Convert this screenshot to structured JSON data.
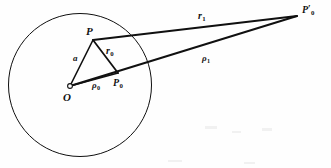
{
  "figure": {
    "background_color": "#fefefe",
    "stroke_color": "#101010",
    "circle": {
      "name": "boundary-circle",
      "center_x": 80,
      "center_y": 85,
      "radius": 71.5,
      "stroke_width": 1.0
    },
    "points": [
      {
        "id": "O",
        "label": "O",
        "sub": "",
        "prime": false,
        "x": 70,
        "y": 86,
        "marker": "open-circle",
        "label_x": 63,
        "label_y": 92,
        "size": "sz-big"
      },
      {
        "id": "P",
        "label": "P",
        "sub": "",
        "prime": false,
        "x": 93,
        "y": 40,
        "marker": "none",
        "label_x": 86,
        "label_y": 26,
        "size": "sz-big"
      },
      {
        "id": "P0",
        "label": "P",
        "sub": "0",
        "prime": false,
        "x": 118,
        "y": 73,
        "marker": "none",
        "label_x": 113,
        "label_y": 78,
        "size": "sz-mid"
      },
      {
        "id": "P0prime",
        "label": "P",
        "sub": "0",
        "prime": true,
        "x": 297,
        "y": 16,
        "marker": "none",
        "label_x": 302,
        "label_y": 5,
        "size": "sz-mid"
      }
    ],
    "segments": [
      {
        "id": "a",
        "from": "O",
        "to": "P",
        "stroke_width": 1.6
      },
      {
        "id": "r0",
        "from": "P",
        "to": "P0",
        "stroke_width": 1.8
      },
      {
        "id": "rho0",
        "from": "O",
        "to": "P0",
        "stroke_width": 1.6
      },
      {
        "id": "r1",
        "from": "P",
        "to": "P0prime",
        "stroke_width": 2.0
      },
      {
        "id": "rho1",
        "from": "O",
        "to": "P0prime",
        "stroke_width": 2.0
      }
    ],
    "length_labels": [
      {
        "id": "a",
        "label": "a",
        "sub": "",
        "x": 73,
        "y": 54,
        "size": "sz-sm"
      },
      {
        "id": "r0",
        "label": "r",
        "sub": "0",
        "x": 106,
        "y": 46,
        "size": "sz-mid"
      },
      {
        "id": "rho0",
        "label": "ρ",
        "sub": "0",
        "x": 92,
        "y": 81,
        "size": "sz-mid"
      },
      {
        "id": "r1",
        "label": "r",
        "sub": "1",
        "x": 198,
        "y": 11,
        "size": "sz-mid"
      },
      {
        "id": "rho1",
        "label": "ρ",
        "sub": "1",
        "x": 202,
        "y": 54,
        "size": "sz-mid"
      }
    ]
  }
}
